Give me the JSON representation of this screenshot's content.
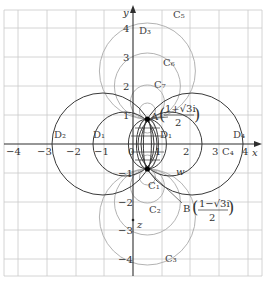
{
  "figure": {
    "axes": {
      "x_label": "x",
      "y_label": "y",
      "x_ticks": [
        "−4",
        "−3",
        "−2",
        "−1",
        "0",
        "1",
        "2",
        "3",
        "4"
      ],
      "y_ticks": [
        "4",
        "3",
        "2",
        "1",
        "−1",
        "−2",
        "−3",
        "−4"
      ],
      "origin_label": "0"
    },
    "points": {
      "A": {
        "label": "A",
        "expr_num": "1+√3i",
        "expr_den": "2"
      },
      "B": {
        "label": "B",
        "expr_num": "1−√3i",
        "expr_den": "2"
      },
      "w": {
        "label": "w"
      },
      "z": {
        "label": "z"
      }
    },
    "circle_labels": {
      "C1": "C₁",
      "C2": "C₂",
      "C3": "C₃",
      "C4": "C₄",
      "C5": "C₅",
      "C6": "C₆",
      "C7": "C₇",
      "D1": "D₁",
      "D2": "D₂",
      "D3": "D₃",
      "D4": "D₄"
    },
    "colors": {
      "grid": "#c8c8c8",
      "axis": "#333333",
      "c_family": "#a8a8a8",
      "d_family": "#333333",
      "point": "#000000"
    }
  }
}
